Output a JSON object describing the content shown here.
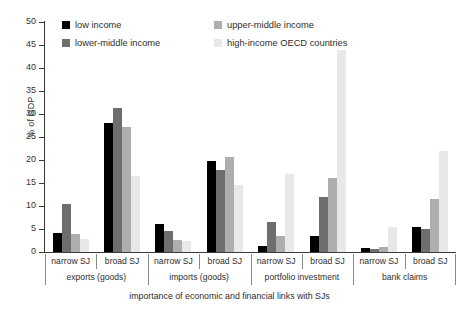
{
  "chart_data": {
    "type": "bar",
    "title": "",
    "xlabel": "importance of economic and financial links with SJs",
    "ylabel": "% of GDP",
    "ylim": [
      0,
      50
    ],
    "yticks": [
      0,
      5,
      10,
      15,
      20,
      25,
      30,
      35,
      40,
      45,
      50
    ],
    "grid": false,
    "legend_position": "top-left-inside",
    "categories": [
      "narrow SJ / exports (goods)",
      "broad SJ / exports (goods)",
      "narrow SJ / imports (goods)",
      "broad SJ / imports (goods)",
      "narrow SJ / portfolio investment",
      "broad SJ / portfolio investment",
      "narrow SJ / bank claims",
      "broad SJ / bank claims"
    ],
    "groups": [
      {
        "main_label": "exports (goods)",
        "subgroups": [
          {
            "label": "narrow SJ",
            "values": [
              4.2,
              10.5,
              4.0,
              2.8
            ]
          },
          {
            "label": "broad SJ",
            "values": [
              28.0,
              31.3,
              27.2,
              16.5
            ]
          }
        ]
      },
      {
        "main_label": "imports (goods)",
        "subgroups": [
          {
            "label": "narrow SJ",
            "values": [
              6.0,
              4.5,
              2.7,
              2.5
            ]
          },
          {
            "label": "broad SJ",
            "values": [
              19.8,
              17.8,
              20.7,
              14.5
            ]
          }
        ]
      },
      {
        "main_label": "portfolio investment",
        "subgroups": [
          {
            "label": "narrow SJ",
            "values": [
              1.3,
              6.5,
              3.5,
              17.0
            ]
          },
          {
            "label": "broad SJ",
            "values": [
              3.5,
              12.0,
              16.0,
              44.0
            ]
          }
        ]
      },
      {
        "main_label": "bank claims",
        "subgroups": [
          {
            "label": "narrow SJ",
            "values": [
              0.8,
              0.6,
              1.0,
              5.5
            ]
          },
          {
            "label": "broad SJ",
            "values": [
              5.5,
              5.0,
              11.5,
              22.0
            ]
          }
        ]
      }
    ],
    "series": [
      {
        "name": "low income",
        "color": "#000000",
        "values": [
          4.2,
          28.0,
          6.0,
          19.8,
          1.3,
          3.5,
          0.8,
          5.5
        ]
      },
      {
        "name": "lower-middle income",
        "color": "#6e6e6e",
        "values": [
          10.5,
          31.3,
          4.5,
          17.8,
          6.5,
          12.0,
          0.6,
          5.0
        ]
      },
      {
        "name": "upper-middle income",
        "color": "#aeaeae",
        "values": [
          4.0,
          27.2,
          2.7,
          20.7,
          3.5,
          16.0,
          1.0,
          11.5
        ]
      },
      {
        "name": "high-income OECD countries",
        "color": "#e8e8e8",
        "values": [
          2.8,
          16.5,
          2.5,
          14.5,
          17.0,
          44.0,
          5.5,
          22.0
        ]
      }
    ]
  },
  "legend": {
    "items": [
      {
        "label": "low income",
        "color": "#000000"
      },
      {
        "label": "upper-middle income",
        "color": "#aeaeae"
      },
      {
        "label": "lower-middle income",
        "color": "#6e6e6e"
      },
      {
        "label": "high-income OECD countries",
        "color": "#e8e8e8"
      }
    ]
  },
  "axes": {
    "y_title": "% of GDP",
    "x_title": "importance of economic and financial links with SJs",
    "y_tick_labels": [
      "0",
      "5",
      "10",
      "15",
      "20",
      "25",
      "30",
      "35",
      "40",
      "45",
      "50"
    ]
  }
}
